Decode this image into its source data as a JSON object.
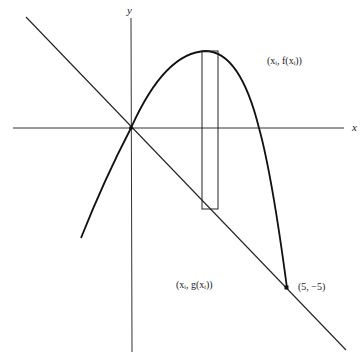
{
  "figure": {
    "axis_labels": {
      "x": "x",
      "y": "y"
    },
    "labels": {
      "upper_point": "(xᵢ, f(xᵢ))",
      "lower_point": "(xᵢ, g(xᵢ))",
      "intersection": "(5,  −5)"
    },
    "curves": [
      {
        "name": "f",
        "kind": "parabola",
        "description": "concave-down curve through origin, peak near x≈2.4, meets g at (5,-5)"
      },
      {
        "name": "g",
        "kind": "line",
        "description": "y = -x, through origin and (5,-5)"
      }
    ],
    "rectangle": {
      "description": "representative vertical strip from g(xᵢ) up to f(xᵢ)"
    },
    "points": [
      {
        "label": "origin",
        "x": 0,
        "y": 0
      },
      {
        "label": "(5, -5)",
        "x": 5,
        "y": -5
      }
    ]
  }
}
